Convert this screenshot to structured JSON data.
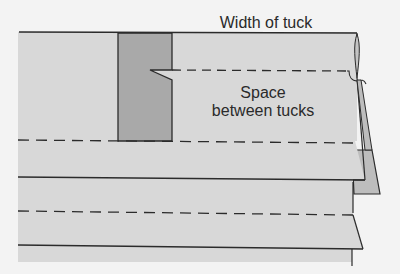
{
  "diagram": {
    "labels": {
      "width_of_tuck": "Width of tuck",
      "space_line1": "Space",
      "space_line2": "between tucks"
    },
    "colors": {
      "page": "#f3f3f3",
      "fabric": "#d8d8d8",
      "tuck_fold": "#a9a9a9",
      "pleat_edge": "#bdbdbd",
      "line": "#2b2b2b"
    },
    "lines": [
      {
        "type": "solid",
        "y": 32,
        "role": "top-edge"
      },
      {
        "type": "dashed",
        "y": 70,
        "role": "tuck-width-stitch-line"
      },
      {
        "type": "dashed",
        "y": 141,
        "role": "tuck-stitch-line"
      },
      {
        "type": "solid",
        "y": 178,
        "role": "fold-line"
      },
      {
        "type": "dashed",
        "y": 213,
        "role": "tuck-stitch-line"
      },
      {
        "type": "solid",
        "y": 246,
        "role": "fold-line"
      }
    ]
  }
}
